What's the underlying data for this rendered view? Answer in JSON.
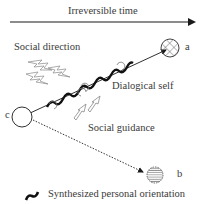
{
  "diagram": {
    "title_axis": "Irreversible time",
    "labels": {
      "social_direction": "Social direction",
      "dialogical_self": "Dialogical self",
      "social_guidance": "Social guidance",
      "point_a": "a",
      "point_b": "b",
      "point_c": "c"
    },
    "legend": {
      "synthesized": "Synthesized personal orientation"
    },
    "nodes": [
      {
        "id": "c",
        "style": "empty-circle"
      },
      {
        "id": "a",
        "style": "crosshatched-circle"
      },
      {
        "id": "b",
        "style": "horizontal-striped-dashed-circle"
      }
    ],
    "edges": [
      {
        "from": "c",
        "to": "a",
        "style": "solid-arrow-with-wave"
      },
      {
        "from": "c",
        "to": "b",
        "style": "dotted-arrow"
      }
    ],
    "colors": {
      "line": "#1a1a1a",
      "text": "#3a3a3a",
      "outline": "#666666"
    }
  }
}
